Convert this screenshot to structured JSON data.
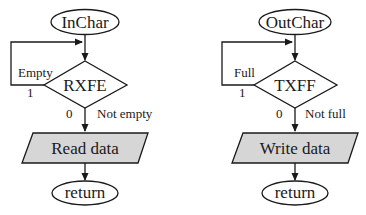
{
  "colors": {
    "stroke": "#1a1a1a",
    "io_fill": "#d6d6d6",
    "background": "#ffffff"
  },
  "flowcharts": [
    {
      "id": "inchar",
      "start_label": "InChar",
      "decision_label": "RXFE",
      "loop_condition_label": "Empty",
      "loop_value_label": "1",
      "exit_value_label": "0",
      "exit_condition_label": "Not empty",
      "action_label": "Read data",
      "end_label": "return"
    },
    {
      "id": "outchar",
      "start_label": "OutChar",
      "decision_label": "TXFF",
      "loop_condition_label": "Full",
      "loop_value_label": "1",
      "exit_value_label": "0",
      "exit_condition_label": "Not full",
      "action_label": "Write data",
      "end_label": "return"
    }
  ]
}
